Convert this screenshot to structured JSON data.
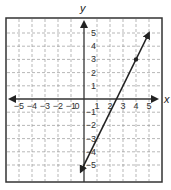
{
  "chart_data": {
    "type": "line",
    "title": "",
    "xlabel": "x",
    "ylabel": "y",
    "xlim": [
      -5.5,
      5.5
    ],
    "ylim": [
      -5.5,
      5.5
    ],
    "grid": true,
    "grid_style": "dashed",
    "x_ticks": [
      "-5",
      "-4",
      "-3",
      "-2",
      "-1",
      "0",
      "1",
      "2",
      "3",
      "4",
      "5"
    ],
    "y_ticks": [
      "5",
      "4",
      "3",
      "2",
      "1",
      "-1",
      "-2",
      "-3",
      "-4",
      "-5"
    ],
    "series": [
      {
        "name": "line",
        "equation": "y = 2x - 5",
        "slope": 2,
        "intercept": -5,
        "x": [
          -0.25,
          5
        ],
        "y": [
          -5.5,
          5
        ],
        "arrows": "both",
        "color": "#222222"
      }
    ],
    "points": [
      {
        "x": 4,
        "y": 3,
        "label": ""
      }
    ]
  },
  "axes": {
    "x_label": "x",
    "y_label": "y",
    "origin_label": "0"
  }
}
